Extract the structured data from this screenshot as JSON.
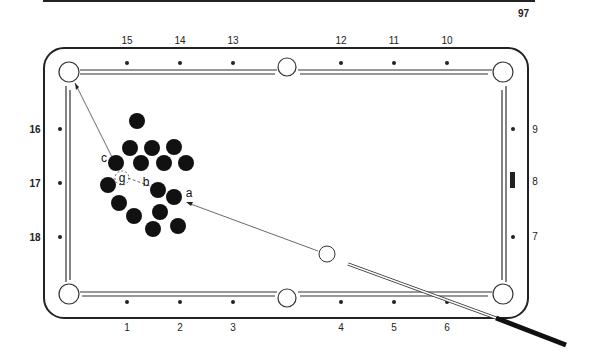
{
  "page": {
    "number": "97"
  },
  "diagram": {
    "title": "",
    "diamond_labels": {
      "top": [
        "15",
        "14",
        "13",
        "12",
        "11",
        "10"
      ],
      "bottom": [
        "1",
        "2",
        "3",
        "4",
        "5",
        "6"
      ],
      "left": [
        "16",
        "17",
        "18"
      ],
      "right": [
        "9",
        "8",
        "7"
      ]
    },
    "ball_labels": {
      "a": "a",
      "b": "b",
      "c": "c",
      "g": "g"
    },
    "colors": {
      "ink": "#222222",
      "ball": "#111111",
      "paper": "#ffffff"
    }
  }
}
